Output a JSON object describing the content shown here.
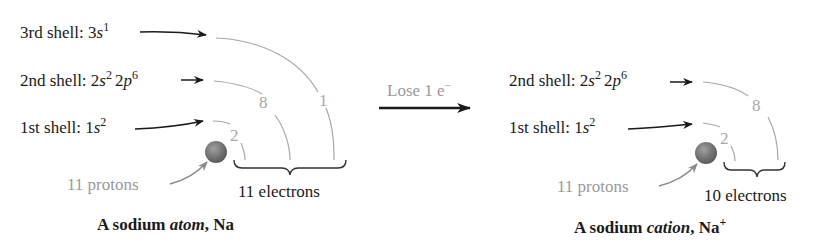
{
  "atom": {
    "shells": [
      {
        "label": "3rd shell: ",
        "config": [
          {
            "base": "3",
            "sub": "s",
            "sup": "1"
          }
        ],
        "count": "1"
      },
      {
        "label": "2nd shell: ",
        "config": [
          {
            "base": "2",
            "sub": "s",
            "sup": "2"
          },
          {
            "base": "2",
            "sub": "p",
            "sup": "6"
          }
        ],
        "count": "8"
      },
      {
        "label": "1st shell: ",
        "config": [
          {
            "base": "1",
            "sub": "s",
            "sup": "2"
          }
        ],
        "count": "2"
      }
    ],
    "protons_label": "11 protons",
    "electrons_label": "11 electrons",
    "caption": {
      "prefix": "A sodium ",
      "italic": "atom",
      "suffix": ", Na",
      "sup": ""
    }
  },
  "process": {
    "label": "Lose 1 e",
    "label_sup": "−"
  },
  "cation": {
    "shells": [
      {
        "label": "2nd shell: ",
        "config": [
          {
            "base": "2",
            "sub": "s",
            "sup": "2"
          },
          {
            "base": "2",
            "sub": "p",
            "sup": "6"
          }
        ],
        "count": "8"
      },
      {
        "label": "1st shell: ",
        "config": [
          {
            "base": "1",
            "sub": "s",
            "sup": "2"
          }
        ],
        "count": "2"
      }
    ],
    "protons_label": "11 protons",
    "electrons_label": "10 electrons",
    "caption": {
      "prefix": "A sodium ",
      "italic": "cation",
      "suffix": ", Na",
      "sup": "+"
    }
  },
  "colors": {
    "text": "#1a1a1a",
    "muted": "#9a9a9a",
    "nucleus": "#7a7a7a"
  }
}
